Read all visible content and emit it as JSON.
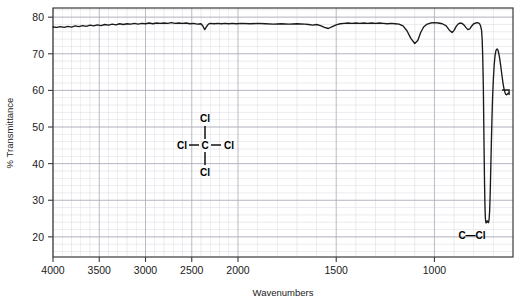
{
  "chart_data": {
    "type": "line",
    "title": "",
    "xlabel": "Wavenumbers",
    "ylabel": "% Transmittance",
    "xticks": [
      4000,
      3500,
      3000,
      2500,
      2000,
      1500,
      1000
    ],
    "xtick_labels": [
      "4000",
      "3500",
      "3000",
      "2500",
      "2000",
      "1500",
      "1000"
    ],
    "yticks": [
      80,
      70,
      60,
      50,
      40,
      30,
      20
    ],
    "ytick_labels": [
      "80",
      "70",
      "60",
      "50",
      "40",
      "30",
      "20"
    ],
    "xlim": [
      4000,
      600
    ],
    "ylim": [
      14.5,
      82.5
    ],
    "grid": true,
    "legend": null,
    "axis_scale_note": "split-linear: 4000-2000 compressed, 2000-600 expanded",
    "line_color": "#1a1a1a",
    "grid_color": "#c8c8d2",
    "series": [
      {
        "name": "CCl4 transmittance",
        "points": [
          [
            4000,
            77.3
          ],
          [
            3960,
            77.2
          ],
          [
            3920,
            77.4
          ],
          [
            3880,
            77.2
          ],
          [
            3840,
            77.5
          ],
          [
            3800,
            77.3
          ],
          [
            3760,
            77.6
          ],
          [
            3720,
            77.4
          ],
          [
            3680,
            77.7
          ],
          [
            3640,
            77.5
          ],
          [
            3600,
            77.8
          ],
          [
            3560,
            77.6
          ],
          [
            3520,
            77.9
          ],
          [
            3480,
            77.7
          ],
          [
            3440,
            78.0
          ],
          [
            3400,
            77.8
          ],
          [
            3360,
            78.1
          ],
          [
            3320,
            77.9
          ],
          [
            3280,
            78.2
          ],
          [
            3240,
            78.0
          ],
          [
            3200,
            78.2
          ],
          [
            3160,
            78.1
          ],
          [
            3120,
            78.3
          ],
          [
            3080,
            78.1
          ],
          [
            3040,
            78.3
          ],
          [
            3000,
            78.2
          ],
          [
            2960,
            78.4
          ],
          [
            2920,
            78.2
          ],
          [
            2880,
            78.4
          ],
          [
            2840,
            78.3
          ],
          [
            2800,
            78.4
          ],
          [
            2760,
            78.3
          ],
          [
            2720,
            78.5
          ],
          [
            2680,
            78.3
          ],
          [
            2640,
            78.4
          ],
          [
            2600,
            78.3
          ],
          [
            2560,
            78.4
          ],
          [
            2520,
            78.2
          ],
          [
            2480,
            78.3
          ],
          [
            2440,
            78.1
          ],
          [
            2400,
            78.2
          ],
          [
            2380,
            77.6
          ],
          [
            2360,
            76.6
          ],
          [
            2340,
            77.4
          ],
          [
            2320,
            78.1
          ],
          [
            2300,
            78.3
          ],
          [
            2260,
            78.2
          ],
          [
            2220,
            78.3
          ],
          [
            2180,
            78.2
          ],
          [
            2140,
            78.3
          ],
          [
            2100,
            78.2
          ],
          [
            2060,
            78.3
          ],
          [
            2020,
            78.2
          ],
          [
            1980,
            78.3
          ],
          [
            1940,
            78.2
          ],
          [
            1900,
            78.3
          ],
          [
            1860,
            78.2
          ],
          [
            1820,
            78.1
          ],
          [
            1780,
            78.2
          ],
          [
            1740,
            78.1
          ],
          [
            1700,
            78.2
          ],
          [
            1660,
            78.1
          ],
          [
            1640,
            78.0
          ],
          [
            1620,
            77.8
          ],
          [
            1600,
            78.0
          ],
          [
            1580,
            77.7
          ],
          [
            1560,
            77.2
          ],
          [
            1540,
            76.9
          ],
          [
            1520,
            77.4
          ],
          [
            1500,
            77.9
          ],
          [
            1480,
            78.2
          ],
          [
            1460,
            78.3
          ],
          [
            1440,
            78.4
          ],
          [
            1420,
            78.3
          ],
          [
            1400,
            78.4
          ],
          [
            1380,
            78.3
          ],
          [
            1360,
            78.4
          ],
          [
            1340,
            78.3
          ],
          [
            1320,
            78.4
          ],
          [
            1300,
            78.3
          ],
          [
            1280,
            78.4
          ],
          [
            1260,
            78.3
          ],
          [
            1240,
            78.2
          ],
          [
            1220,
            78.3
          ],
          [
            1200,
            78.2
          ],
          [
            1180,
            78.1
          ],
          [
            1160,
            77.6
          ],
          [
            1140,
            76.3
          ],
          [
            1120,
            74.2
          ],
          [
            1100,
            72.8
          ],
          [
            1085,
            73.6
          ],
          [
            1070,
            75.8
          ],
          [
            1055,
            77.3
          ],
          [
            1040,
            78.0
          ],
          [
            1020,
            78.4
          ],
          [
            1000,
            78.5
          ],
          [
            980,
            78.4
          ],
          [
            960,
            78.2
          ],
          [
            940,
            77.6
          ],
          [
            925,
            76.5
          ],
          [
            910,
            75.8
          ],
          [
            900,
            76.4
          ],
          [
            890,
            77.4
          ],
          [
            880,
            78.1
          ],
          [
            870,
            78.4
          ],
          [
            860,
            78.3
          ],
          [
            850,
            77.9
          ],
          [
            840,
            77.2
          ],
          [
            830,
            76.6
          ],
          [
            820,
            76.8
          ],
          [
            810,
            77.6
          ],
          [
            800,
            78.2
          ],
          [
            790,
            78.4
          ],
          [
            780,
            78.5
          ],
          [
            775,
            78.4
          ],
          [
            770,
            78.2
          ],
          [
            765,
            77.6
          ],
          [
            760,
            76.4
          ],
          [
            757,
            74.0
          ],
          [
            754,
            69.0
          ],
          [
            751,
            61.0
          ],
          [
            749,
            52.0
          ],
          [
            747,
            43.0
          ],
          [
            745,
            35.0
          ],
          [
            743,
            29.0
          ],
          [
            741,
            25.5
          ],
          [
            739,
            24.2
          ],
          [
            737,
            23.8
          ],
          [
            734,
            24.1
          ],
          [
            731,
            24.4
          ],
          [
            728,
            24.0
          ],
          [
            725,
            23.9
          ],
          [
            722,
            24.6
          ],
          [
            719,
            27.0
          ],
          [
            716,
            32.0
          ],
          [
            713,
            39.0
          ],
          [
            710,
            46.0
          ],
          [
            707,
            52.5
          ],
          [
            704,
            58.0
          ],
          [
            700,
            63.0
          ],
          [
            696,
            66.8
          ],
          [
            692,
            69.2
          ],
          [
            688,
            70.6
          ],
          [
            684,
            71.2
          ],
          [
            680,
            71.3
          ],
          [
            676,
            70.9
          ],
          [
            672,
            70.0
          ],
          [
            668,
            68.8
          ],
          [
            664,
            67.3
          ],
          [
            660,
            65.7
          ],
          [
            656,
            64.0
          ],
          [
            652,
            62.4
          ],
          [
            648,
            61.0
          ],
          [
            644,
            60.0
          ],
          [
            640,
            59.3
          ],
          [
            636,
            58.9
          ],
          [
            632,
            58.8
          ],
          [
            628,
            59.0
          ],
          [
            624,
            59.2
          ],
          [
            620,
            59.3
          ]
        ]
      }
    ],
    "annotations": [
      {
        "name": "peak-label-c-cl",
        "text": "C—Cl",
        "x": 755,
        "y": 21.5
      }
    ],
    "molecule": {
      "name": "carbon tetrachloride",
      "center_atom": "C",
      "top_atom": "Cl",
      "left_atom": "Cl",
      "right_atom": "Cl",
      "bottom_atom": "Cl"
    }
  }
}
